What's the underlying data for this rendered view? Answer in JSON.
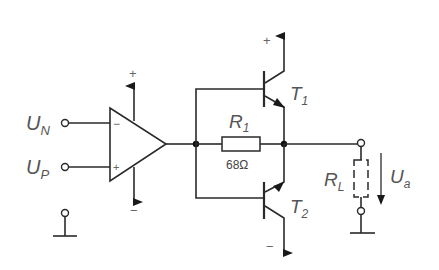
{
  "diagram": {
    "type": "circuit-schematic",
    "inputs": {
      "inverting": {
        "label": "U",
        "sub": "N"
      },
      "non_inverting": {
        "label": "U",
        "sub": "P"
      }
    },
    "opamp": {
      "minus_sign": "−",
      "plus_sign": "+",
      "supply_pos": "+",
      "supply_neg": "−"
    },
    "resistor_r1": {
      "label": "R",
      "sub": "1",
      "value": "68Ω"
    },
    "transistor_t1": {
      "label": "T",
      "sub": "1",
      "supply": "+"
    },
    "transistor_t2": {
      "label": "T",
      "sub": "2",
      "supply": "−"
    },
    "load": {
      "label": "R",
      "sub": "L"
    },
    "output_voltage": {
      "label": "U",
      "sub": "a"
    }
  }
}
